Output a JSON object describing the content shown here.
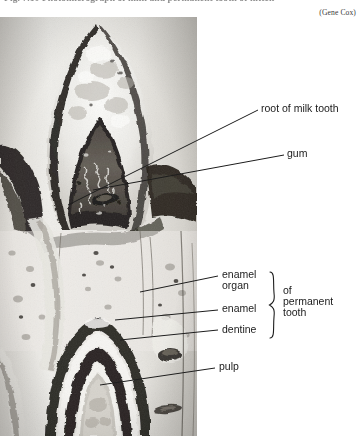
{
  "figure": {
    "caption": "Fig. 7.10    Photomicrograph of milk and permanent tooth of kitten",
    "credit": "(Gene Cox)",
    "image_name": "photomicrograph-milk-and-permanent-tooth",
    "image_type": "black-and-white histological section photomicrograph"
  },
  "labels": [
    {
      "id": "root-of-milk-tooth",
      "text": "root of milk tooth"
    },
    {
      "id": "gum",
      "text": "gum"
    },
    {
      "id": "enamel-organ",
      "text": "enamel\norgan"
    },
    {
      "id": "enamel-organ-line1",
      "text": "enamel"
    },
    {
      "id": "enamel-organ-line2",
      "text": "organ"
    },
    {
      "id": "enamel",
      "text": "enamel"
    },
    {
      "id": "dentine",
      "text": "dentine"
    },
    {
      "id": "pulp",
      "text": "pulp"
    }
  ],
  "brace_group": {
    "line1": "of",
    "line2": "permanent",
    "line3": "tooth"
  },
  "colors": {
    "ink": "#1b1b1b",
    "leader_line": "#1d1d1d",
    "paper": "#ffffff",
    "photo_light": "#f4f3f0",
    "photo_mid": "#b9b6b0",
    "photo_dark": "#2a2724"
  }
}
